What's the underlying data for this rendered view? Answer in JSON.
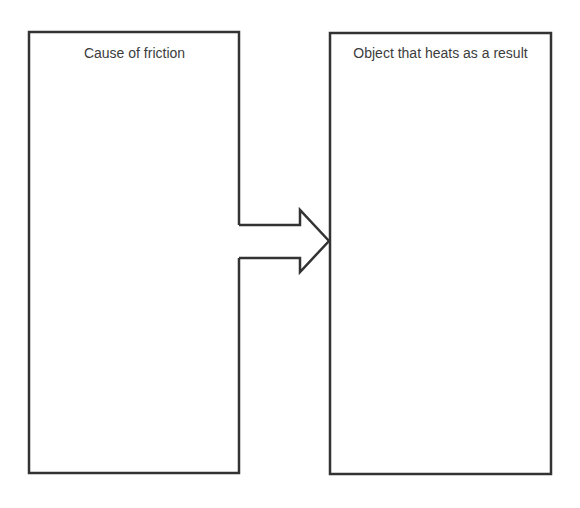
{
  "diagram": {
    "left_box": {
      "title": "Cause of friction"
    },
    "right_box": {
      "title": "Object that heats as a result"
    },
    "arrow": {
      "direction": "right"
    },
    "stroke_color": "#333333"
  }
}
